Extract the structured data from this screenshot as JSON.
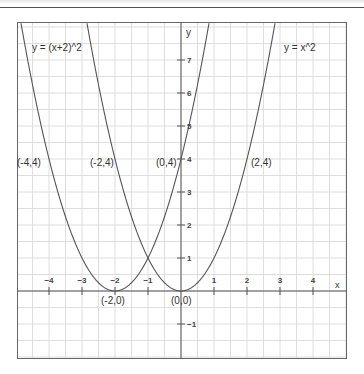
{
  "chart_data": {
    "type": "line",
    "title": "",
    "xlabel": "x",
    "ylabel": "y",
    "xlim": [
      -5,
      5
    ],
    "ylim": [
      -2,
      8
    ],
    "grid": true,
    "grid_step": 0.5,
    "x_ticks": [
      -4,
      -3,
      -2,
      -1,
      1,
      2,
      3,
      4
    ],
    "x_tick_labels": [
      "−4",
      "−3",
      "−2",
      "−1",
      "1",
      "2",
      "3",
      "4"
    ],
    "y_ticks": [
      -1,
      1,
      2,
      3,
      4,
      5,
      6,
      7
    ],
    "y_tick_labels": [
      "−1",
      "1",
      "2",
      "3",
      "4",
      "5",
      "6",
      "7"
    ],
    "series": [
      {
        "name": "y = (x+2)^2",
        "function": "(x+2)^2",
        "color": "#555555",
        "x": [
          -4.9,
          -4,
          -3,
          -2,
          -1,
          0,
          0.9
        ],
        "y": [
          8.41,
          4,
          1,
          0,
          1,
          4,
          8.41
        ]
      },
      {
        "name": "y = x^2",
        "function": "x^2",
        "color": "#555555",
        "x": [
          -2.9,
          -2,
          -1,
          0,
          1,
          2,
          2.9
        ],
        "y": [
          8.41,
          4,
          1,
          0,
          1,
          4,
          8.41
        ]
      }
    ],
    "annotations": [
      {
        "text": "y = (x+2)^2",
        "x": -4.5,
        "y": 7.5
      },
      {
        "text": "y = x^2",
        "x": 3.5,
        "y": 7.5
      },
      {
        "text": "(-4,4)",
        "x": -4,
        "y": 4
      },
      {
        "text": "(-2,4)",
        "x": -2,
        "y": 4
      },
      {
        "text": "(0,4)",
        "x": 0,
        "y": 4
      },
      {
        "text": "(2,4)",
        "x": 2,
        "y": 4
      },
      {
        "text": "(-2,0)",
        "x": -2,
        "y": 0
      },
      {
        "text": "(0,0)",
        "x": 0,
        "y": 0
      }
    ]
  },
  "labels": {
    "eq_left": "y = (x+2)^2",
    "eq_right": "y = x^2",
    "pt_m4_4": "(-4,4)",
    "pt_m2_4": "(-2,4)",
    "pt_0_4": "(0,4)",
    "pt_2_4": "(2,4)",
    "pt_m2_0": "(-2,0)",
    "pt_0_0": "(0,0)",
    "axis_x": "x",
    "axis_y": "y"
  }
}
